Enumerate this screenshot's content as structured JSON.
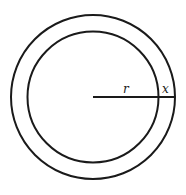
{
  "diagram": {
    "shapes": [
      {
        "name": "outer-circle",
        "label": ""
      },
      {
        "name": "inner-circle",
        "label": ""
      }
    ],
    "labels": {
      "inner_radius": "r",
      "ring_width": "x"
    },
    "stroke_color": "#1a1a1a",
    "background": "#ffffff"
  }
}
